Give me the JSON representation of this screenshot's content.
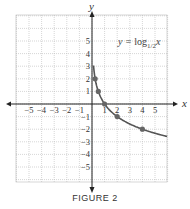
{
  "chart_data": {
    "type": "line",
    "title": "",
    "caption": "FIGURE 2",
    "annotation": "y = log1/2 x",
    "annotation_parts": {
      "y": "y",
      "eq": "=",
      "log": "log",
      "base": "1/2",
      "arg": "x"
    },
    "xlabel": "x",
    "ylabel": "y",
    "xlim": [
      -6,
      6
    ],
    "ylim": [
      -6,
      6
    ],
    "grid": true,
    "x_ticks": [
      -5,
      -4,
      -3,
      -2,
      -1,
      1,
      2,
      3,
      4,
      5
    ],
    "y_ticks": [
      -5,
      -4,
      -3,
      -2,
      -1,
      1,
      2,
      3,
      4,
      5
    ],
    "x_tick_labels": [
      "−5",
      "−4",
      "−3",
      "−2",
      "−1",
      "1",
      "2",
      "3",
      "4",
      "5"
    ],
    "y_tick_labels": [
      "−5",
      "−4",
      "−3",
      "−2",
      "−1",
      "1",
      "2",
      "3",
      "4",
      "5"
    ],
    "series": [
      {
        "name": "y = log_{1/2} x",
        "x": [
          0.25,
          0.5,
          1,
          2,
          4
        ],
        "y": [
          2,
          1,
          0,
          -1,
          -2
        ],
        "marked_points": true
      }
    ],
    "colors": {
      "curve": "#555555",
      "points": "#666666",
      "grid": "#bbbbbb",
      "axes": "#222222"
    }
  }
}
